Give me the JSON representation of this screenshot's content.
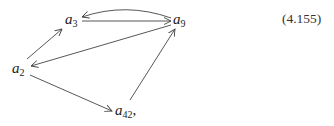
{
  "diagram": {
    "equation_number": "(4.155)",
    "nodes": [
      {
        "id": "a3",
        "base": "a",
        "sub": "3",
        "suffix": ""
      },
      {
        "id": "a9",
        "base": "a",
        "sub": "9",
        "suffix": ""
      },
      {
        "id": "a2",
        "base": "a",
        "sub": "2",
        "suffix": ""
      },
      {
        "id": "a42",
        "base": "a",
        "sub": "42",
        "suffix": ","
      }
    ],
    "edges": [
      {
        "from": "a2",
        "to": "a3",
        "style": "straight"
      },
      {
        "from": "a3",
        "to": "a9",
        "style": "straight"
      },
      {
        "from": "a9",
        "to": "a3",
        "style": "curved"
      },
      {
        "from": "a9",
        "to": "a2",
        "style": "straight"
      },
      {
        "from": "a2",
        "to": "a42",
        "style": "straight"
      },
      {
        "from": "a42",
        "to": "a9",
        "style": "straight"
      }
    ],
    "colors": {
      "line": "#444444",
      "text": "#222222"
    }
  }
}
